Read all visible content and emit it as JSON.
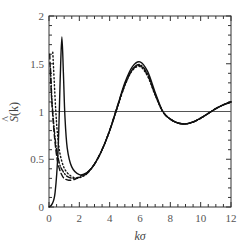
{
  "chart_data": {
    "type": "line",
    "title": "",
    "xlabel": "kσ",
    "ylabel": "Ŝ(k)",
    "xlim": [
      0,
      12
    ],
    "ylim": [
      0,
      2
    ],
    "grid": false,
    "legend": null,
    "x_ticks": [
      0,
      2,
      4,
      6,
      8,
      10,
      12
    ],
    "x_tick_labels": [
      "0",
      "2",
      "4",
      "6",
      "8",
      "10",
      "12"
    ],
    "y_ticks": [
      0,
      0.5,
      1,
      1.5,
      2
    ],
    "y_tick_labels": [
      "0",
      "0.5",
      "1",
      "1.5",
      "2"
    ],
    "reference_line": {
      "y": 1,
      "style": "solid-thin"
    },
    "series": [
      {
        "name": "solid",
        "style": "solid",
        "x": [
          0,
          0.2,
          0.4,
          0.6,
          0.75,
          0.85,
          0.95,
          1.05,
          1.2,
          1.5,
          2.0,
          2.5,
          3.0,
          3.5,
          4.0,
          4.5,
          5.0,
          5.5,
          6.0,
          6.5,
          7.0,
          7.5,
          8.0,
          8.5,
          9.0,
          9.5,
          10.0,
          10.5,
          11.0,
          11.5,
          12.0
        ],
        "y": [
          0,
          0.03,
          0.15,
          0.6,
          1.4,
          1.78,
          1.4,
          0.95,
          0.62,
          0.42,
          0.34,
          0.36,
          0.45,
          0.6,
          0.8,
          1.05,
          1.3,
          1.47,
          1.52,
          1.42,
          1.2,
          1.0,
          0.92,
          0.88,
          0.87,
          0.89,
          0.93,
          0.98,
          1.03,
          1.07,
          1.1
        ]
      },
      {
        "name": "dashed",
        "style": "dashed",
        "x": [
          0.05,
          0.15,
          0.3,
          0.45,
          0.6,
          0.8,
          1.0,
          1.3,
          1.7,
          2.0,
          2.5,
          3.0,
          3.5,
          4.0,
          4.5,
          5.0,
          5.5,
          6.0,
          6.5,
          7.0,
          7.5,
          8.0,
          8.5,
          9.0,
          9.5,
          10.0,
          10.5,
          11.0,
          11.5,
          12.0
        ],
        "y": [
          1.6,
          1.2,
          0.85,
          0.6,
          0.45,
          0.35,
          0.3,
          0.28,
          0.29,
          0.32,
          0.36,
          0.45,
          0.6,
          0.8,
          1.05,
          1.28,
          1.44,
          1.48,
          1.38,
          1.18,
          1.0,
          0.92,
          0.88,
          0.87,
          0.89,
          0.93,
          0.98,
          1.03,
          1.07,
          1.1
        ]
      },
      {
        "name": "dotted",
        "style": "dotted",
        "x": [
          0.25,
          0.35,
          0.45,
          0.55,
          0.7,
          0.9,
          1.1,
          1.4,
          1.8,
          2.2,
          2.5,
          3.0,
          3.5,
          4.0,
          4.5,
          5.0,
          5.5,
          6.0,
          6.5,
          7.0,
          7.5,
          8.0,
          8.5,
          9.0,
          9.5,
          10.0,
          10.5,
          11.0,
          11.5,
          12.0
        ],
        "y": [
          1.62,
          1.3,
          1.0,
          0.78,
          0.58,
          0.45,
          0.38,
          0.33,
          0.3,
          0.32,
          0.35,
          0.45,
          0.6,
          0.8,
          1.04,
          1.27,
          1.43,
          1.47,
          1.37,
          1.17,
          1.0,
          0.92,
          0.88,
          0.87,
          0.89,
          0.93,
          0.98,
          1.03,
          1.07,
          1.1
        ]
      },
      {
        "name": "dash-dot",
        "style": "dashdot",
        "x": [
          0.1,
          0.2,
          0.35,
          0.5,
          0.7,
          0.9,
          1.2,
          1.6,
          2.0,
          2.5,
          3.0,
          3.5,
          4.0,
          4.5,
          5.0,
          5.5,
          6.0,
          6.5,
          7.0,
          7.5,
          8.0,
          8.5,
          9.0,
          9.5,
          10.0,
          10.5,
          11.0,
          11.5,
          12.0
        ],
        "y": [
          1.45,
          1.1,
          0.8,
          0.6,
          0.45,
          0.38,
          0.32,
          0.3,
          0.31,
          0.35,
          0.45,
          0.6,
          0.8,
          1.04,
          1.28,
          1.44,
          1.49,
          1.39,
          1.18,
          1.0,
          0.92,
          0.88,
          0.87,
          0.89,
          0.93,
          0.98,
          1.03,
          1.07,
          1.1
        ]
      }
    ]
  },
  "labels": {
    "xlabel": "kσ",
    "ylabel_main": "S",
    "ylabel_hat": "^",
    "ylabel_arg": "(k)"
  },
  "colors": {
    "axis": "#333333",
    "curve": "#111111",
    "reference": "#555555",
    "text": "#555555"
  }
}
